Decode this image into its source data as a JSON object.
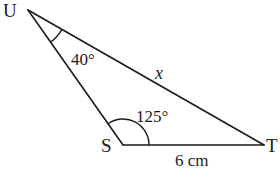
{
  "diagram": {
    "type": "triangle",
    "vertices": {
      "U": {
        "label": "U"
      },
      "S": {
        "label": "S"
      },
      "T": {
        "label": "T"
      }
    },
    "angles": {
      "U": {
        "label": "40°",
        "value_deg": 40
      },
      "S": {
        "label": "125°",
        "value_deg": 125
      }
    },
    "sides": {
      "ST": {
        "label": "6 cm",
        "value": 6,
        "unit": "cm"
      },
      "UT": {
        "label": "x",
        "unknown": true
      }
    }
  }
}
